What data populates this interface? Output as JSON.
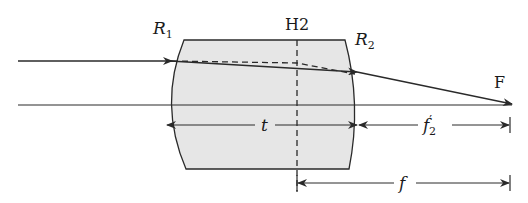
{
  "diagram": {
    "type": "thick-lens-ray-diagram",
    "labels": {
      "surface1": "R",
      "surface1_sub": "1",
      "surface2": "R",
      "surface2_sub": "2",
      "principal_plane": "H2",
      "focal_point": "F",
      "thickness": "t",
      "back_focal": "f",
      "back_focal_prime": "′",
      "back_focal_sub": "2",
      "focal_length": "f"
    },
    "colors": {
      "lens_fill": "#e6e6e6",
      "stroke": "#2a2a2a",
      "background": "#ffffff"
    }
  }
}
